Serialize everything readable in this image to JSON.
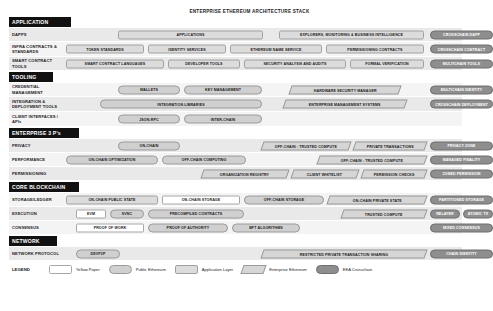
{
  "title": "ENTERPRISE ETHEREUM ARCHITECTURE STACK",
  "colors": {
    "section_header_bg": "#111111",
    "yellow_paper": "#ffffff",
    "public_ethereum": "#d0d0d0",
    "application_layer": "#dcdcdc",
    "enterprise_ethereum": "#d6d6d6",
    "eea_crosschain": "#8e8e8e"
  },
  "sections": [
    {
      "name": "APPLICATION",
      "rows": [
        {
          "label": "DAPPS",
          "items": [
            {
              "text": "APPLICATIONS",
              "type": "app",
              "left": 52,
              "width": 145
            },
            {
              "text": "EXPLORERS, MONITORING & BUSINESS INTELLIGENCE",
              "type": "app",
              "left": 213,
              "width": 145
            },
            {
              "text": "CROSSCHAIN DAPP",
              "type": "cross",
              "left": 364,
              "width": 63
            }
          ]
        },
        {
          "label": "INFRA CONTRACTS & STANDARDS",
          "items": [
            {
              "text": "TOKEN STANDARDS",
              "type": "app",
              "left": 0,
              "width": 78
            },
            {
              "text": "IDENTITY SERVICES",
              "type": "app",
              "left": 82,
              "width": 78
            },
            {
              "text": "ETHEREUM NAME SERVICE",
              "type": "app",
              "left": 164,
              "width": 92
            },
            {
              "text": "PERMISSIONING CONTRACTS",
              "type": "app",
              "left": 260,
              "width": 98
            },
            {
              "text": "CROSSCHAIN CONTRACT",
              "type": "cross",
              "left": 364,
              "width": 63
            }
          ]
        },
        {
          "label": "SMART CONTRACT TOOLS",
          "items": [
            {
              "text": "SMART CONTRACT LANGUAGES",
              "type": "app",
              "left": 0,
              "width": 98
            },
            {
              "text": "DEVELOPER TOOLS",
              "type": "app",
              "left": 102,
              "width": 72
            },
            {
              "text": "SECURITY ANALYSIS AND AUDITS",
              "type": "app",
              "left": 178,
              "width": 102
            },
            {
              "text": "FORMAL VERIFICATION",
              "type": "app",
              "left": 284,
              "width": 74
            },
            {
              "text": "MULTICHAIN TOOLS",
              "type": "cross",
              "left": 364,
              "width": 63
            }
          ]
        }
      ]
    },
    {
      "name": "TOOLING",
      "rows": [
        {
          "label": "CREDENTIAL MANAGEMENT",
          "items": [
            {
              "text": "WALLETS",
              "type": "public",
              "left": 52,
              "width": 62
            },
            {
              "text": "KEY MANAGEMENT",
              "type": "public",
              "left": 118,
              "width": 78
            },
            {
              "text": "HARDWARE SECURITY MANAGER",
              "type": "ent",
              "left": 224,
              "width": 110
            },
            {
              "text": "MULTICHAIN IDENTITY",
              "type": "cross",
              "left": 364,
              "width": 63
            }
          ]
        },
        {
          "label": "INTEGRATION & DEPLOYMENT TOOLS",
          "items": [
            {
              "text": "INTEGRATION LIBRARIES",
              "type": "public",
              "left": 34,
              "width": 162
            },
            {
              "text": "ENTERPRISE MANAGEMENT SYSTEMS",
              "type": "ent",
              "left": 218,
              "width": 122
            },
            {
              "text": "CROSSCHAIN DEPLOYMENT",
              "type": "cross",
              "left": 364,
              "width": 63
            }
          ]
        },
        {
          "label": "CLIENT INTERFACES / APIs",
          "items": [
            {
              "text": "JSON-RPC",
              "type": "public",
              "left": 52,
              "width": 62
            },
            {
              "text": "INTER-CHAIN",
              "type": "public",
              "left": 118,
              "width": 78
            }
          ]
        }
      ]
    },
    {
      "name": "ENTERPRISE 3 P's",
      "rows": [
        {
          "label": "PRIVACY",
          "items": [
            {
              "text": "ON-CHAIN",
              "type": "public",
              "left": 52,
              "width": 62
            },
            {
              "text": "OFF-CHAIN : TRUSTED COMPUTE",
              "type": "ent",
              "left": 196,
              "width": 88
            },
            {
              "text": "PRIVATE TRANSACTIONS",
              "type": "ent",
              "left": 288,
              "width": 72
            },
            {
              "text": "PRIVACY ZONE",
              "type": "cross",
              "left": 364,
              "width": 63
            }
          ]
        },
        {
          "label": "PERFORMANCE",
          "items": [
            {
              "text": "ON-CHAIN OPTIMIZATION",
              "type": "public",
              "left": 0,
              "width": 92
            },
            {
              "text": "OFF-CHAIN COMPUTING",
              "type": "public",
              "left": 96,
              "width": 84
            },
            {
              "text": "OFF-CHAIN : TRUSTED COMPUTE",
              "type": "ent",
              "left": 252,
              "width": 108
            },
            {
              "text": "MANAGED FINALITY",
              "type": "cross",
              "left": 364,
              "width": 63
            }
          ]
        },
        {
          "label": "PERMISSIONING",
          "items": [
            {
              "text": "ORGANIZATION REGISTRY",
              "type": "ent",
              "left": 136,
              "width": 86
            },
            {
              "text": "CLIENT WHITELIST",
              "type": "ent",
              "left": 226,
              "width": 66
            },
            {
              "text": "PERMISSION CHECKS",
              "type": "ent",
              "left": 296,
              "width": 64
            },
            {
              "text": "ZONED PERMISSION",
              "type": "cross",
              "left": 364,
              "width": 63
            }
          ]
        }
      ]
    },
    {
      "name": "CORE BLOCKCHAIN",
      "rows": [
        {
          "label": "STORAGE/LEDGER",
          "items": [
            {
              "text": "ON-CHAIN PUBLIC STATE",
              "type": "app",
              "left": 0,
              "width": 92
            },
            {
              "text": "ON-CHAIN STORAGE",
              "type": "yellow",
              "left": 96,
              "width": 78
            },
            {
              "text": "OFF-CHAIN STORAGE",
              "type": "public",
              "left": 178,
              "width": 80
            },
            {
              "text": "ON-CHAIN PRIVATE STATE",
              "type": "ent",
              "left": 262,
              "width": 98
            },
            {
              "text": "PARTITIONED STORAGE",
              "type": "cross",
              "left": 364,
              "width": 63
            }
          ]
        },
        {
          "label": "EXECUTION",
          "items": [
            {
              "text": "EVM",
              "type": "yellow",
              "left": 10,
              "width": 30
            },
            {
              "text": "SVNC",
              "type": "public",
              "left": 44,
              "width": 34
            },
            {
              "text": "PRECOMPILED CONTRACTS",
              "type": "public",
              "left": 82,
              "width": 96
            },
            {
              "text": "TRUSTED COMPUTE",
              "type": "ent",
              "left": 276,
              "width": 84
            },
            {
              "text": "RELAYER",
              "type": "cross",
              "left": 364,
              "width": 30
            },
            {
              "text": "ATOMIC TX",
              "type": "cross",
              "left": 397,
              "width": 30
            }
          ]
        },
        {
          "label": "CONSENSUS",
          "items": [
            {
              "text": "PROOF OF WORK",
              "type": "yellow",
              "left": 10,
              "width": 68
            },
            {
              "text": "PROOF OF AUTHORITY",
              "type": "public",
              "left": 82,
              "width": 80
            },
            {
              "text": "BFT ALGORITHMS",
              "type": "public",
              "left": 166,
              "width": 68
            },
            {
              "text": "MIXED CONSENSUS",
              "type": "cross",
              "left": 364,
              "width": 63
            }
          ]
        }
      ]
    },
    {
      "name": "NETWORK",
      "rows": [
        {
          "label": "NETWORK PROTOCOL",
          "items": [
            {
              "text": "DEVP2P",
              "type": "public",
              "left": 10,
              "width": 44
            },
            {
              "text": "RESTRICTED PRIVATE TRANSACTION SHARING",
              "type": "ent",
              "left": 196,
              "width": 164
            },
            {
              "text": "CHAIN IDENTITY",
              "type": "cross",
              "left": 364,
              "width": 63
            }
          ]
        }
      ]
    }
  ],
  "legend": {
    "title": "LEGEND",
    "entries": [
      {
        "text": "Yellow Paper",
        "type": "yellow"
      },
      {
        "text": "Public Ethereum",
        "type": "public"
      },
      {
        "text": "Application Layer",
        "type": "app"
      },
      {
        "text": "Enterprise Ethereum",
        "type": "ent"
      },
      {
        "text": "EEA Crosschain",
        "type": "cross"
      }
    ]
  }
}
